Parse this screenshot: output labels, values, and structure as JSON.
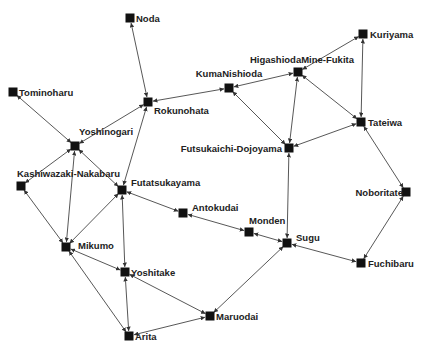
{
  "diagram": {
    "type": "network-graph",
    "node_color": "#111111",
    "edge_color": "#444444",
    "nodes": [
      {
        "id": "Noda",
        "label": "Noda",
        "x": 130,
        "y": 18,
        "lx": 6,
        "ly": 4,
        "anchor": "start"
      },
      {
        "id": "Tominoharu",
        "label": "Tominoharu",
        "x": 13,
        "y": 92,
        "lx": 6,
        "ly": 4,
        "anchor": "start"
      },
      {
        "id": "Rokunohata",
        "label": "Rokunohata",
        "x": 148,
        "y": 102,
        "lx": 6,
        "ly": 12,
        "anchor": "start"
      },
      {
        "id": "Yoshinogari",
        "label": "Yoshinogari",
        "x": 75,
        "y": 146,
        "lx": 4,
        "ly": -11,
        "anchor": "start"
      },
      {
        "id": "Kashiwazaki-Nakabaru",
        "label": "Kashiwazaki-Nakabaru",
        "x": 21,
        "y": 186,
        "lx": -4,
        "ly": -9,
        "anchor": "start"
      },
      {
        "id": "Futatsukayama",
        "label": "Futatsukayama",
        "x": 122,
        "y": 190,
        "lx": 9,
        "ly": -4,
        "anchor": "start"
      },
      {
        "id": "Antokudai",
        "label": "Antokudai",
        "x": 183,
        "y": 213,
        "lx": 9,
        "ly": -2,
        "anchor": "start"
      },
      {
        "id": "Mikumo",
        "label": "Mikumo",
        "x": 66,
        "y": 247,
        "lx": 12,
        "ly": 2,
        "anchor": "start"
      },
      {
        "id": "Yoshitake",
        "label": "Yoshitake",
        "x": 125,
        "y": 272,
        "lx": 6,
        "ly": 4,
        "anchor": "start"
      },
      {
        "id": "Arita",
        "label": "Arita",
        "x": 129,
        "y": 336,
        "lx": 6,
        "ly": 4,
        "anchor": "start"
      },
      {
        "id": "Maruodai",
        "label": "Maruodai",
        "x": 210,
        "y": 316,
        "lx": 6,
        "ly": 4,
        "anchor": "start"
      },
      {
        "id": "Monden",
        "label": "Monden",
        "x": 249,
        "y": 232,
        "lx": 0,
        "ly": -8,
        "anchor": "start"
      },
      {
        "id": "Sugu",
        "label": "Sugu",
        "x": 287,
        "y": 243,
        "lx": 9,
        "ly": -2,
        "anchor": "start"
      },
      {
        "id": "Fuchibaru",
        "label": "Fuchibaru",
        "x": 361,
        "y": 263,
        "lx": 7,
        "ly": 4,
        "anchor": "start"
      },
      {
        "id": "Noboritate",
        "label": "Noboritate",
        "x": 406,
        "y": 192,
        "lx": -3,
        "ly": 4,
        "anchor": "end"
      },
      {
        "id": "Tateiwa",
        "label": "Tateiwa",
        "x": 361,
        "y": 122,
        "lx": 7,
        "ly": 4,
        "anchor": "start"
      },
      {
        "id": "Kuriyama",
        "label": "Kuriyama",
        "x": 363,
        "y": 34,
        "lx": 7,
        "ly": 4,
        "anchor": "start"
      },
      {
        "id": "HigashiodaMine-Fukita",
        "label": "HigashiodaMine-Fukita",
        "x": 298,
        "y": 72,
        "lx": 4,
        "ly": -9,
        "anchor": "middle"
      },
      {
        "id": "KumaNishioda",
        "label": "KumaNishioda",
        "x": 229,
        "y": 88,
        "lx": 0,
        "ly": -11,
        "anchor": "middle"
      },
      {
        "id": "Futsukaichi-Dojoyama",
        "label": "Futsukaichi-Dojoyama",
        "x": 289,
        "y": 148,
        "lx": -7,
        "ly": 4,
        "anchor": "end"
      }
    ],
    "edges": [
      [
        "Noda",
        "Rokunohata"
      ],
      [
        "Tominoharu",
        "Yoshinogari"
      ],
      [
        "Rokunohata",
        "Yoshinogari"
      ],
      [
        "Rokunohata",
        "KumaNishioda"
      ],
      [
        "Rokunohata",
        "Futatsukayama"
      ],
      [
        "Yoshinogari",
        "Kashiwazaki-Nakabaru"
      ],
      [
        "Yoshinogari",
        "Mikumo"
      ],
      [
        "Yoshinogari",
        "Futatsukayama"
      ],
      [
        "Kashiwazaki-Nakabaru",
        "Mikumo"
      ],
      [
        "Futatsukayama",
        "Mikumo"
      ],
      [
        "Futatsukayama",
        "Yoshitake"
      ],
      [
        "Futatsukayama",
        "Antokudai"
      ],
      [
        "Antokudai",
        "Monden"
      ],
      [
        "Monden",
        "Sugu"
      ],
      [
        "Mikumo",
        "Yoshitake"
      ],
      [
        "Mikumo",
        "Arita"
      ],
      [
        "Yoshitake",
        "Arita"
      ],
      [
        "Yoshitake",
        "Maruodai"
      ],
      [
        "Arita",
        "Maruodai"
      ],
      [
        "Maruodai",
        "Sugu"
      ],
      [
        "Sugu",
        "Fuchibaru"
      ],
      [
        "Sugu",
        "Futsukaichi-Dojoyama"
      ],
      [
        "Fuchibaru",
        "Noboritate"
      ],
      [
        "Noboritate",
        "Tateiwa"
      ],
      [
        "Tateiwa",
        "Kuriyama"
      ],
      [
        "Tateiwa",
        "HigashiodaMine-Fukita"
      ],
      [
        "Tateiwa",
        "Futsukaichi-Dojoyama"
      ],
      [
        "Kuriyama",
        "HigashiodaMine-Fukita"
      ],
      [
        "HigashiodaMine-Fukita",
        "KumaNishioda"
      ],
      [
        "HigashiodaMine-Fukita",
        "Futsukaichi-Dojoyama"
      ],
      [
        "KumaNishioda",
        "Futsukaichi-Dojoyama"
      ]
    ]
  }
}
